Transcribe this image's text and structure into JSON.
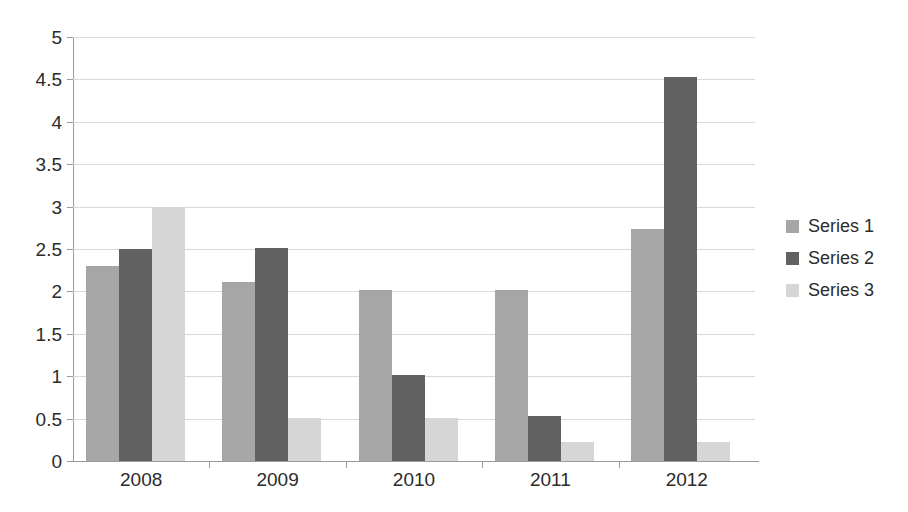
{
  "chart_data": {
    "type": "bar",
    "title": "",
    "xlabel": "",
    "ylabel": "",
    "categories": [
      "2008",
      "2009",
      "2010",
      "2011",
      "2012"
    ],
    "series": [
      {
        "name": "Series 1",
        "color": "#a6a6a6",
        "values": [
          2.3,
          2.11,
          2.02,
          2.02,
          2.74
        ]
      },
      {
        "name": "Series 2",
        "color": "#616161",
        "values": [
          2.5,
          2.51,
          1.01,
          0.53,
          4.53
        ]
      },
      {
        "name": "Series 3",
        "color": "#d6d6d6",
        "values": [
          3.0,
          0.51,
          0.51,
          0.22,
          0.22
        ]
      }
    ],
    "ylim": [
      0,
      5
    ],
    "ytick_labels": [
      "0",
      "0.5",
      "1",
      "1.5",
      "2",
      "2.5",
      "3",
      "3.5",
      "4",
      "4.5",
      "5"
    ],
    "ytick_values": [
      0,
      0.5,
      1,
      1.5,
      2,
      2.5,
      3,
      3.5,
      4,
      4.5,
      5
    ],
    "grid": true,
    "legend_position": "right"
  },
  "legend": {
    "items": [
      {
        "label": "Series 1"
      },
      {
        "label": "Series 2"
      },
      {
        "label": "Series 3"
      }
    ]
  }
}
